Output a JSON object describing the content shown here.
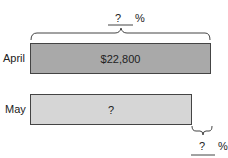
{
  "rows": [
    {
      "label": "April",
      "bar_text": "$22,800",
      "color": "#a9a9a9"
    },
    {
      "label": "May",
      "bar_text": "?",
      "color": "#d6d6d6"
    }
  ],
  "top_brace": {
    "unknown": "?",
    "unit": "%"
  },
  "bottom_brace": {
    "unknown": "?",
    "unit": "%"
  }
}
